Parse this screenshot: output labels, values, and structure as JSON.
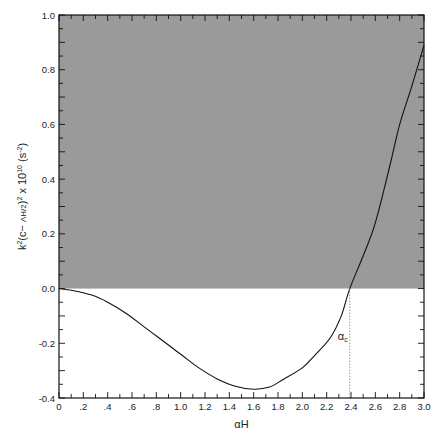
{
  "chart_data": {
    "type": "line",
    "title": "",
    "xlabel": "αH",
    "ylabel": "k²(c− ΛH/2)² × 10¹⁰ (s⁻²)",
    "xlim": [
      0,
      3.0
    ],
    "ylim": [
      -0.4,
      1.0
    ],
    "x_ticks": [
      "0",
      ".2",
      ".4",
      ".6",
      ".8",
      "1.0",
      "1.2",
      "1.4",
      "1.6",
      "1.8",
      "2.0",
      "2.2",
      "2.4",
      "2.6",
      "2.8",
      "3.0"
    ],
    "x_tick_values": [
      0,
      0.2,
      0.4,
      0.6,
      0.8,
      1.0,
      1.2,
      1.4,
      1.6,
      1.8,
      2.0,
      2.2,
      2.4,
      2.6,
      2.8,
      3.0
    ],
    "y_ticks": [
      "1.0",
      "0.8",
      "0.6",
      "0.4",
      "0.2",
      "0.0",
      "-0.2",
      "-0.4"
    ],
    "y_tick_values": [
      1.0,
      0.8,
      0.6,
      0.4,
      0.2,
      0.0,
      -0.2,
      -0.4
    ],
    "shaded_region": {
      "y_from": 0.0,
      "y_to": 1.0,
      "color": "#9a9a9a"
    },
    "annotation": {
      "text": "α",
      "subscript": "c",
      "x": 2.39,
      "style": "dotted vertical line from y=0 to y=-0.4"
    },
    "series": [
      {
        "name": "curve",
        "x": [
          0,
          0.1,
          0.27,
          0.4,
          0.55,
          0.7,
          0.82,
          1.0,
          1.15,
          1.3,
          1.45,
          1.6,
          1.73,
          1.85,
          2.0,
          2.1,
          2.23,
          2.32,
          2.39,
          2.5,
          2.6,
          2.72,
          2.8,
          2.9,
          3.0
        ],
        "y": [
          0,
          -0.006,
          -0.024,
          -0.05,
          -0.09,
          -0.14,
          -0.18,
          -0.24,
          -0.29,
          -0.33,
          -0.357,
          -0.368,
          -0.36,
          -0.33,
          -0.29,
          -0.245,
          -0.18,
          -0.1,
          0.0,
          0.12,
          0.24,
          0.45,
          0.6,
          0.74,
          0.89
        ]
      }
    ],
    "grid": false,
    "legend": null
  }
}
